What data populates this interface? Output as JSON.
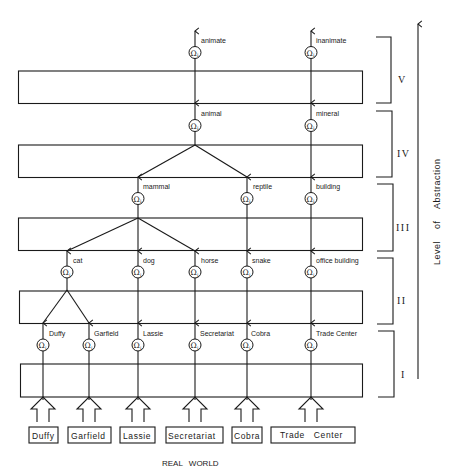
{
  "diagram": {
    "title": "",
    "omega_symbol": "Ω",
    "omega_subscript": "i",
    "axis_label": "Level of Abstraction",
    "bottom_label": "REAL WORLD",
    "levels": [
      {
        "id": "I",
        "label": "I"
      },
      {
        "id": "II",
        "label": "II"
      },
      {
        "id": "III",
        "label": "III"
      },
      {
        "id": "IV",
        "label": "IV"
      },
      {
        "id": "V",
        "label": "V"
      }
    ],
    "real_world_objects": [
      "Duffy",
      "Garfield",
      "Lassie",
      "Secretariat",
      "Cobra",
      "Trade Center"
    ],
    "level_outputs": {
      "I": [
        "Duffy",
        "Garfield",
        "Lassie",
        "Secretariat",
        "Cobra",
        "Trade Center"
      ],
      "II": [
        "cat",
        "dog",
        "horse",
        "snake",
        "office building"
      ],
      "III": [
        "mammal",
        "reptile",
        "building"
      ],
      "IV": [
        "animal",
        "mineral"
      ],
      "V": [
        "animate",
        "inanimate"
      ]
    },
    "edges": {
      "II": [
        [
          "Duffy",
          "cat"
        ],
        [
          "Garfield",
          "cat"
        ],
        [
          "Lassie",
          "dog"
        ],
        [
          "Secretariat",
          "horse"
        ],
        [
          "Cobra",
          "snake"
        ],
        [
          "Trade Center",
          "office building"
        ]
      ],
      "III": [
        [
          "cat",
          "mammal"
        ],
        [
          "dog",
          "mammal"
        ],
        [
          "horse",
          "mammal"
        ],
        [
          "snake",
          "reptile"
        ],
        [
          "office building",
          "building"
        ]
      ],
      "IV": [
        [
          "mammal",
          "animal"
        ],
        [
          "reptile",
          "animal"
        ],
        [
          "building",
          "mineral"
        ]
      ],
      "V": [
        [
          "animal",
          "animate"
        ],
        [
          "mineral",
          "inanimate"
        ]
      ]
    }
  }
}
